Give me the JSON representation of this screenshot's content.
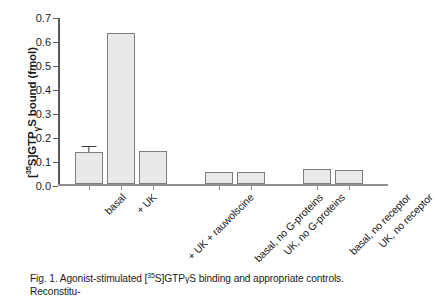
{
  "figure": {
    "caption": "Fig. 1. Agonist-stimulated [35S]GTPγS binding and appropriate controls. Reconstitu-",
    "caption_parts": {
      "prefix": "Fig. 1. Agonist-stimulated [",
      "superscript": "35",
      "middle": "S]GTP",
      "gamma": "γ",
      "suffix": "S binding and appropriate controls. Reconstitu-"
    }
  },
  "axis": {
    "ylabel_parts": {
      "open": "[",
      "superscript": "35",
      "mid": "S]GTP",
      "gamma": "γ",
      "close": "S bound (fmol)"
    },
    "ylabel_plain": "[35S]GTPγS bound (fmol)",
    "yticks": [
      "0.0",
      "0.1",
      "0.2",
      "0.3",
      "0.4",
      "0.5",
      "0.6",
      "0.7"
    ]
  },
  "colors": {
    "bar_fill": "#e9e9e9",
    "bar_stroke": "#7d7d7d",
    "axis": "#5a5a5a",
    "baseline": "#8f8f8f",
    "error_bar": "#3c3c3c",
    "text": "#1b1b1b",
    "background": "#ffffff"
  },
  "chart_data": {
    "type": "bar",
    "title": "",
    "xlabel": "",
    "ylabel": "[35S]GTPγS bound (fmol)",
    "ylim": [
      0.0,
      0.7
    ],
    "ytick_step": 0.1,
    "grid": false,
    "legend": "none",
    "categories": [
      "basal",
      "+ UK",
      "+ UK + rauwolscine",
      "basal, no G-proteins",
      "UK, no G-proteins",
      "basal, no receptor",
      "UK, no receptor"
    ],
    "values": [
      0.135,
      0.63,
      0.14,
      0.05,
      0.05,
      0.065,
      0.06
    ],
    "errors": [
      0.019,
      0,
      0,
      0,
      0,
      0,
      0
    ],
    "bars": [
      {
        "label": "basal",
        "value": 0.135,
        "error": 0.019,
        "group": "reconstituted"
      },
      {
        "label": "+ UK",
        "value": 0.63,
        "error": 0,
        "group": "reconstituted"
      },
      {
        "label": "+ UK + rauwolscine",
        "value": 0.14,
        "error": 0,
        "group": "reconstituted"
      },
      {
        "label": "basal, no G-proteins",
        "value": 0.05,
        "error": 0,
        "group": "no-G-proteins"
      },
      {
        "label": "UK, no G-proteins",
        "value": 0.05,
        "error": 0,
        "group": "no-G-proteins"
      },
      {
        "label": "basal, no receptor",
        "value": 0.065,
        "error": 0,
        "group": "no-receptor"
      },
      {
        "label": "UK, no receptor",
        "value": 0.06,
        "error": 0,
        "group": "no-receptor"
      }
    ]
  }
}
